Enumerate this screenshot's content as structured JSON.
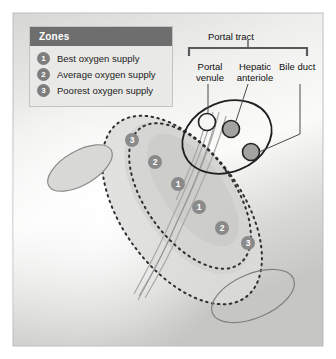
{
  "figure": {
    "panel_bg_top": "#d9d9d7",
    "panel_bg_mid": "#f2f2f0",
    "panel_bg_bottom": "#c9c9c7"
  },
  "legend": {
    "header": "Zones",
    "header_bg": "#6e6e6e",
    "badge_color": "#7d7d7d",
    "items": [
      {
        "number": "1",
        "label": "Best oxygen supply"
      },
      {
        "number": "2",
        "label": "Average oxygen supply"
      },
      {
        "number": "3",
        "label": "Poorest oxygen supply"
      }
    ]
  },
  "callouts": {
    "bracket_label": "Portal tract",
    "portal_venule": "Portal\nvenule",
    "portal_venule_line1": "Portal",
    "portal_venule_line2": "venule",
    "hepatic_arteriole_line1": "Hepatic",
    "hepatic_arteriole_line2": "anteriole",
    "bile_duct": "Bile duct"
  },
  "structures": [
    {
      "name": "portal-venule-circle",
      "fill": "#f4f4f2",
      "stroke": "#2b2b2b",
      "cx": 207,
      "cy": 122,
      "r": 8.5
    },
    {
      "name": "hepatic-arteriole-circle",
      "fill": "#a3a3a1",
      "stroke": "#2b2b2b",
      "cx": 231,
      "cy": 129,
      "r": 8.5
    },
    {
      "name": "bile-duct-circle",
      "fill": "#a3a3a1",
      "stroke": "#2b2b2b",
      "cx": 251,
      "cy": 152,
      "r": 8.5
    }
  ],
  "zone_markers": [
    {
      "number": "3",
      "x": 125,
      "y": 133
    },
    {
      "number": "2",
      "x": 148,
      "y": 155
    },
    {
      "number": "1",
      "x": 171,
      "y": 177
    },
    {
      "number": "1",
      "x": 192,
      "y": 200
    },
    {
      "number": "2",
      "x": 215,
      "y": 221
    },
    {
      "number": "3",
      "x": 241,
      "y": 236
    }
  ],
  "zone_bands": {
    "outer_label": "zone-3-boundary",
    "middle_label": "zone-2-boundary",
    "inner_label": "zone-1-core",
    "dash_color": "#2f2f2f"
  }
}
